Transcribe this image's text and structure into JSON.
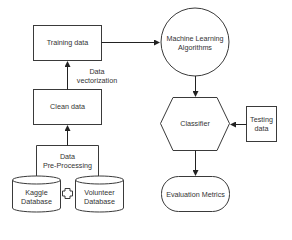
{
  "diagram": {
    "type": "flowchart",
    "colors": {
      "stroke": "#3a3a3a",
      "text": "#333333",
      "background": "#ffffff"
    },
    "nodes": {
      "training_data": {
        "label": "Training data",
        "shape": "rectangle"
      },
      "clean_data": {
        "label": "Clean data",
        "shape": "rectangle"
      },
      "pre_processing": {
        "line1": "Data",
        "line2": "Pre-Processing",
        "shape": "bracket"
      },
      "kaggle_db": {
        "line1": "Kaggle",
        "line2": "Database",
        "shape": "cylinder"
      },
      "volunteer_db": {
        "line1": "Volunteer",
        "line2": "Database",
        "shape": "cylinder"
      },
      "ml_algorithms": {
        "line1": "Machine  Learning",
        "line2": "Algorithms",
        "shape": "circle"
      },
      "classifier": {
        "label": "Classifier",
        "shape": "hexagon"
      },
      "testing_data": {
        "line1": "Testing",
        "line2": "data",
        "shape": "rectangle"
      },
      "evaluation_metrics": {
        "label": "Evaluation Metrics",
        "shape": "stadium"
      }
    },
    "edge_labels": {
      "vectorization": {
        "line1": "Data",
        "line2": "vectorization"
      }
    },
    "combine_symbol": "plus-icon",
    "edges": [
      {
        "from": "pre_processing",
        "to": "clean_data"
      },
      {
        "from": "clean_data",
        "to": "training_data",
        "label": "Data vectorization"
      },
      {
        "from": "training_data",
        "to": "ml_algorithms"
      },
      {
        "from": "ml_algorithms",
        "to": "classifier"
      },
      {
        "from": "testing_data",
        "to": "classifier"
      },
      {
        "from": "classifier",
        "to": "evaluation_metrics"
      }
    ]
  }
}
